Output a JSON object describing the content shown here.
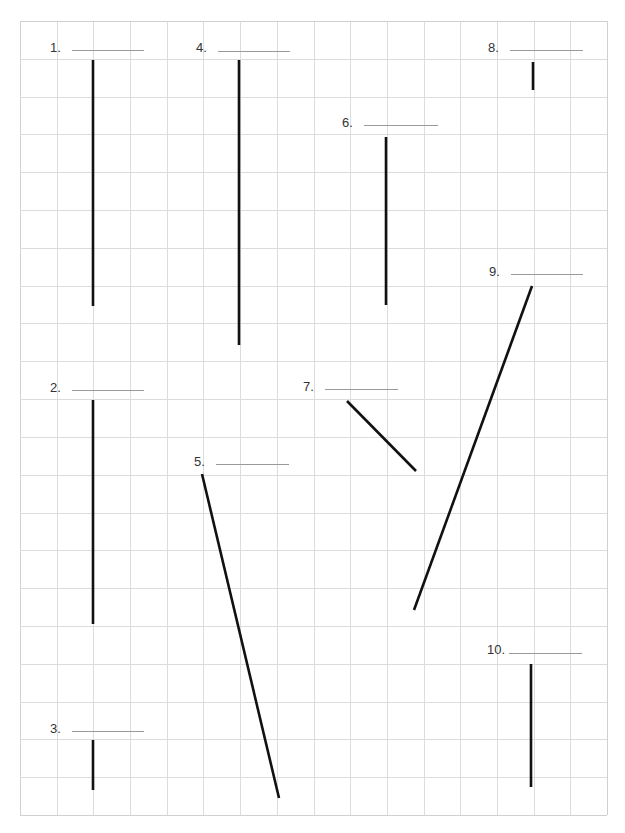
{
  "worksheet": {
    "grid": {
      "left": 20,
      "top": 21,
      "right": 607,
      "bottom": 815,
      "cols": 16,
      "rows": 21,
      "line_color": "#dcdcdc",
      "border_color": "#d0d0d0"
    },
    "segment_color": "#111111",
    "answer_line_color": "#9a9a9a",
    "items": [
      {
        "number": "1.",
        "label_x": 50,
        "label_y": 41,
        "blank_x1": 72,
        "blank_x2": 144,
        "blank_y": 50,
        "x1": 93,
        "y1": 60,
        "x2": 93,
        "y2": 306
      },
      {
        "number": "2.",
        "label_x": 50,
        "label_y": 381,
        "blank_x1": 72,
        "blank_x2": 144,
        "blank_y": 390,
        "x1": 93,
        "y1": 400,
        "x2": 93,
        "y2": 624
      },
      {
        "number": "3.",
        "label_x": 50,
        "label_y": 722,
        "blank_x1": 72,
        "blank_x2": 144,
        "blank_y": 731,
        "x1": 93,
        "y1": 740,
        "x2": 93,
        "y2": 790
      },
      {
        "number": "4.",
        "label_x": 196,
        "label_y": 41,
        "blank_x1": 218,
        "blank_x2": 290,
        "blank_y": 51,
        "x1": 239,
        "y1": 60,
        "x2": 239,
        "y2": 345
      },
      {
        "number": "5.",
        "label_x": 194,
        "label_y": 455,
        "blank_x1": 216,
        "blank_x2": 289,
        "blank_y": 464,
        "x1": 202,
        "y1": 474,
        "x2": 279,
        "y2": 798
      },
      {
        "number": "6.",
        "label_x": 342,
        "label_y": 116,
        "blank_x1": 364,
        "blank_x2": 438,
        "blank_y": 125,
        "x1": 386,
        "y1": 137,
        "x2": 386,
        "y2": 305
      },
      {
        "number": "7.",
        "label_x": 303,
        "label_y": 380,
        "blank_x1": 325,
        "blank_x2": 398,
        "blank_y": 389,
        "x1": 347,
        "y1": 401,
        "x2": 416,
        "y2": 471
      },
      {
        "number": "8.",
        "label_x": 488,
        "label_y": 41,
        "blank_x1": 510,
        "blank_x2": 583,
        "blank_y": 50,
        "x1": 533,
        "y1": 62,
        "x2": 533,
        "y2": 90
      },
      {
        "number": "9.",
        "label_x": 489,
        "label_y": 265,
        "blank_x1": 511,
        "blank_x2": 583,
        "blank_y": 274,
        "x1": 532,
        "y1": 286,
        "x2": 414,
        "y2": 610
      },
      {
        "number": "10.",
        "label_x": 487,
        "label_y": 643,
        "blank_x1": 509,
        "blank_x2": 582,
        "blank_y": 653,
        "x1": 531,
        "y1": 664,
        "x2": 531,
        "y2": 787
      }
    ]
  }
}
